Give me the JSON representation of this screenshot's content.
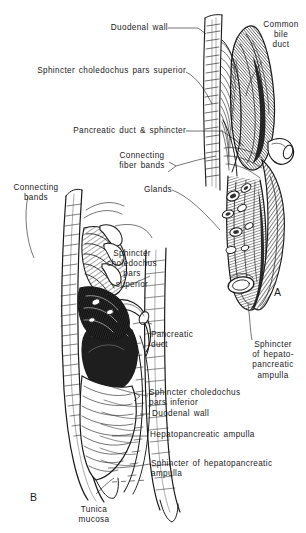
{
  "figure": {
    "kind": "anatomical-line-illustration",
    "background_color": "#ffffff",
    "ink_color": "#1a1a1a",
    "panels": [
      {
        "id": "A",
        "label": "A"
      },
      {
        "id": "B",
        "label": "B"
      }
    ]
  },
  "labels": {
    "duodenal_wall_top": "Duodenal wall",
    "sphincter_choledochus_pars_superior_top": "Sphincter choledochus pars superior",
    "common_bile_duct": "Common\nbile\nduct",
    "pancreatic_duct_and_sphincter": "Pancreatic duct & sphincter",
    "connecting_fiber_bands": "Connecting\nfiber bands",
    "connecting_bands": "Connecting\nbands",
    "glands": "Glands",
    "sphincter_choledochus_pars_superior_b": "Sphincter\ncholedochus\npars\nsuperior",
    "pancreatic_duct": "Pancreatic\nduct",
    "sphincter_of_hepatopancreatic_ampulla_a": "Sphincter\nof hepato-\npancreatic\nampulla",
    "sphincter_choledochus_pars_inferior": "Sphincter choledochus\npars inferior",
    "duodenal_wall_b": "Duodenal wall",
    "hepatopancreatic_ampulla": "Hepatopancreatic ampulla",
    "sphincter_of_hepatopancreatic_ampulla_b": "Sphincter of hepatopancreatic\nampulla",
    "tunica_mucosa": "Tunica\nmucosa"
  }
}
